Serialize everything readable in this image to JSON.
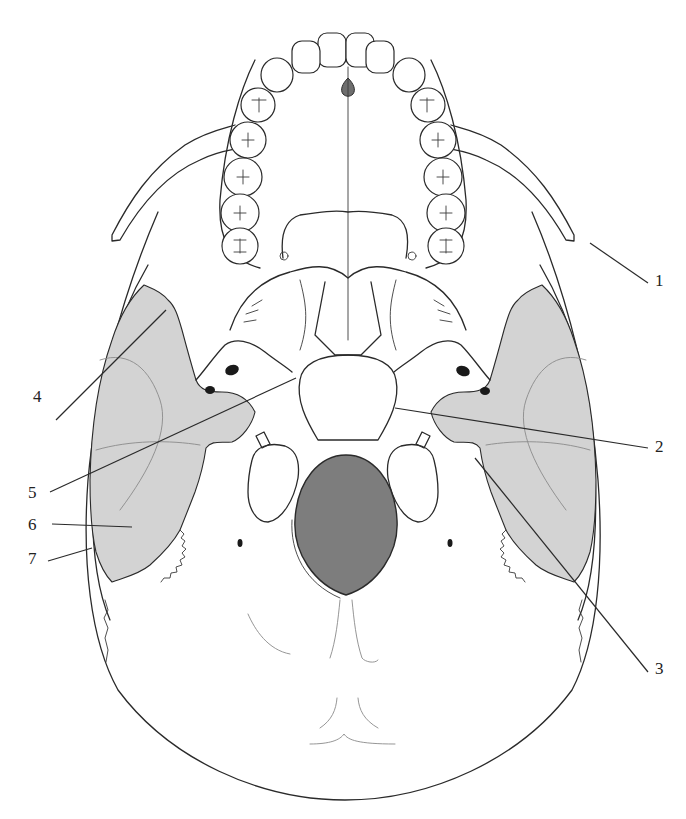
{
  "figure": {
    "view": "inferior / basal",
    "colors": {
      "line": "#2a2a2a",
      "shaded_region": "#d3d3d3",
      "foramen_magnum": "#7d7d7d",
      "incisive_foramen": "#6e6e6e",
      "background": "#ffffff"
    },
    "labels": [
      {
        "id": "1",
        "text": "1",
        "side": "right",
        "x": 655,
        "y": 272
      },
      {
        "id": "2",
        "text": "2",
        "side": "right",
        "x": 655,
        "y": 438
      },
      {
        "id": "3",
        "text": "3",
        "side": "right",
        "x": 655,
        "y": 660
      },
      {
        "id": "4",
        "text": "4",
        "side": "left",
        "x": 33,
        "y": 388
      },
      {
        "id": "5",
        "text": "5",
        "side": "left",
        "x": 28,
        "y": 484
      },
      {
        "id": "6",
        "text": "6",
        "side": "left",
        "x": 28,
        "y": 518
      },
      {
        "id": "7",
        "text": "7",
        "side": "left",
        "x": 28,
        "y": 550
      }
    ]
  }
}
